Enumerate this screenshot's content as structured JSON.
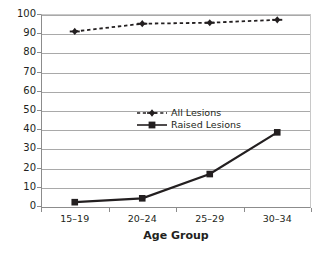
{
  "chart_data": {
    "type": "line",
    "title": "",
    "subtitle": "",
    "xlabel": "Age Group",
    "ylabel": "",
    "categories": [
      "15–19",
      "20–24",
      "25–29",
      "30–34"
    ],
    "ylim": [
      0,
      100
    ],
    "ytick_labels": [
      "0",
      "10",
      "20",
      "30",
      "40",
      "50",
      "60",
      "70",
      "80",
      "90",
      "100"
    ],
    "ytick_values": [
      0,
      10,
      20,
      30,
      40,
      50,
      60,
      70,
      80,
      90,
      100
    ],
    "grid": "horizontal",
    "legend_position": "inside-center",
    "series": [
      {
        "name": "All Lesions",
        "values": [
          91,
          95,
          95.5,
          97
        ],
        "line_style": "dashed",
        "marker": "plus-diamond",
        "color": "#231f20"
      },
      {
        "name": "Raised Lesions",
        "values": [
          3,
          5,
          17.5,
          39
        ],
        "line_style": "solid",
        "marker": "square",
        "color": "#231f20"
      }
    ],
    "annotations": []
  },
  "legend": {
    "items": [
      {
        "label": "All Lesions",
        "key": "dashed-line-with-marker-icon"
      },
      {
        "label": "Raised Lesions",
        "key": "solid-line-with-square-marker-icon"
      }
    ]
  },
  "colors": {
    "series": "#231f20",
    "gridline": "#a9a9a9",
    "axis": "#8c8c8c",
    "plot_background": "#ffffff",
    "text": "#231f20"
  }
}
